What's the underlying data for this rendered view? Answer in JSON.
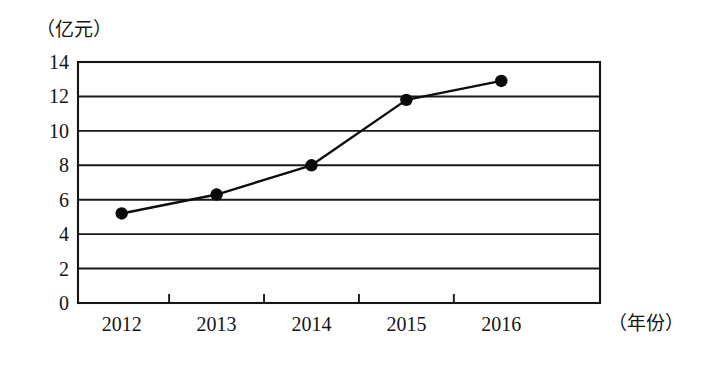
{
  "chart_data": {
    "type": "line",
    "title": "",
    "subtitle": "",
    "xlabel": "（年份）",
    "ylabel": "（亿元）",
    "categories": [
      "2012",
      "2013",
      "2014",
      "2015",
      "2016"
    ],
    "x": [
      2012,
      2013,
      2014,
      2015,
      2016
    ],
    "values": [
      5.2,
      6.3,
      8.0,
      11.8,
      12.9
    ],
    "series": [
      {
        "name": "",
        "values": [
          5.2,
          6.3,
          8.0,
          11.8,
          12.9
        ]
      }
    ],
    "ylim": [
      0,
      14
    ],
    "ytick_labels": [
      "0",
      "2",
      "4",
      "6",
      "8",
      "10",
      "12",
      "14"
    ],
    "ytick_values": [
      0,
      2,
      4,
      6,
      8,
      10,
      12,
      14
    ],
    "xtick_labels": [
      "2012",
      "2013",
      "2014",
      "2015",
      "2016"
    ],
    "grid": "horizontal",
    "legend": "none",
    "marker": "filled-circle",
    "line_color": "#0d0d0d",
    "marker_color": "#0a0a0a",
    "grid_color": "#191919",
    "frame_color": "#151515",
    "background": "#ffffff"
  },
  "axis": {
    "y_unit_label": "（亿元）",
    "x_unit_label": "（年份）"
  }
}
